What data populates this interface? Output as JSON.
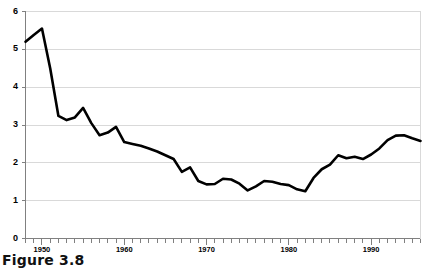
{
  "figure": {
    "caption": "Figure 3.8"
  },
  "chart_data": {
    "type": "line",
    "title": "",
    "xlabel": "",
    "ylabel": "",
    "xlim": [
      1948,
      1996
    ],
    "ylim": [
      0,
      6
    ],
    "grid": "horizontal",
    "legend": "none",
    "y_ticks": [
      0,
      1,
      2,
      3,
      4,
      5,
      6
    ],
    "y_tick_labels": [
      "0",
      "1",
      "2",
      "3",
      "4",
      "5",
      "6"
    ],
    "x_tick_labels": [
      "1950",
      "1960",
      "1970",
      "1980",
      "1990"
    ],
    "x_tick_label_years": [
      1950,
      1960,
      1970,
      1980,
      1990
    ],
    "x_minor_tick_interval": 1,
    "line_color": "#000000",
    "line_width": 2.6,
    "grid_color": "#d9d9d9",
    "axis_color": "#808080",
    "background": "#ffffff",
    "x": [
      1948,
      1949,
      1950,
      1951,
      1952,
      1953,
      1954,
      1955,
      1956,
      1957,
      1958,
      1959,
      1960,
      1961,
      1962,
      1963,
      1964,
      1965,
      1966,
      1967,
      1968,
      1969,
      1970,
      1971,
      1972,
      1973,
      1974,
      1975,
      1976,
      1977,
      1978,
      1979,
      1980,
      1981,
      1982,
      1983,
      1984,
      1985,
      1986,
      1987,
      1988,
      1989,
      1990,
      1991,
      1992,
      1993,
      1994,
      1995,
      1996
    ],
    "values": [
      5.2,
      5.38,
      5.55,
      4.5,
      3.24,
      3.13,
      3.2,
      3.45,
      3.05,
      2.73,
      2.8,
      2.95,
      2.55,
      2.5,
      2.45,
      2.38,
      2.3,
      2.2,
      2.1,
      1.76,
      1.88,
      1.52,
      1.43,
      1.44,
      1.58,
      1.56,
      1.45,
      1.27,
      1.38,
      1.52,
      1.5,
      1.44,
      1.41,
      1.3,
      1.25,
      1.6,
      1.83,
      1.95,
      2.2,
      2.12,
      2.16,
      2.1,
      2.22,
      2.38,
      2.6,
      2.72,
      2.73,
      2.65,
      2.58
    ]
  }
}
